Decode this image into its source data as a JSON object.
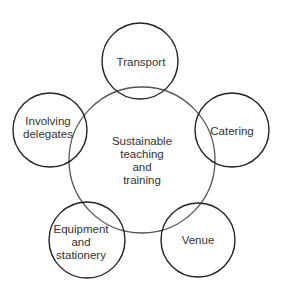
{
  "diagram": {
    "center": {
      "label": "Sustainable\nteaching\nand\ntraining",
      "cx": 142,
      "cy": 160,
      "r": 73
    },
    "nodes": [
      {
        "id": "transport",
        "label": "Transport",
        "cx": 140,
        "cy": 61,
        "r": 38
      },
      {
        "id": "catering",
        "label": "Catering",
        "cx": 232,
        "cy": 130,
        "r": 37
      },
      {
        "id": "venue",
        "label": "Venue",
        "cx": 198,
        "cy": 240,
        "r": 37
      },
      {
        "id": "equipment",
        "label": "Equipment\nand\nstationery",
        "cx": 87,
        "cy": 240,
        "r": 38
      },
      {
        "id": "involving",
        "label": "Involving\ndelegates",
        "cx": 50,
        "cy": 130,
        "r": 37
      }
    ],
    "colors": {
      "stroke": "#222222",
      "text": "#333333",
      "background": "#ffffff"
    }
  }
}
